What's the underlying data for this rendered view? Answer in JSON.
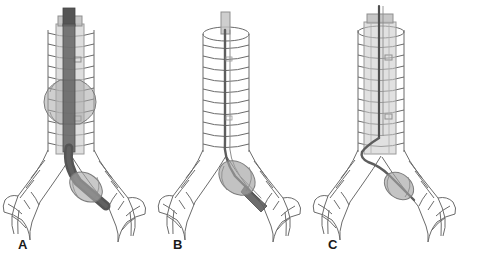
{
  "figure": {
    "background_color": "#ffffff",
    "width": 479,
    "height": 263,
    "panel_count": 3
  },
  "palette": {
    "outline": "#5a5a5a",
    "outline_light": "#8a8a8a",
    "airway_line": "#6b6b6b",
    "tube_translucent": "#c9c9c9",
    "tube_translucent_edge": "#9a9a9a",
    "blocker_dark": "#555555",
    "blocker_darker": "#3f3f3f",
    "cuff_gray": "#a8a8a8",
    "cuff_edge": "#7c7c7c",
    "balloon_gray": "#9e9e9e",
    "label_color": "#1a1a1a"
  },
  "panels": [
    {
      "id": "panel-a",
      "label": "A",
      "caption": "Endotracheal tube with inflated tracheal cuff and bronchial blocker advanced into the left mainstem bronchus",
      "has_endotracheal_tube": true,
      "has_tracheal_cuff": true,
      "blocker_type": "thick-dark-blocker",
      "blocker_cuff_inflated": true,
      "blocker_target": "left-mainstem-bronchus"
    },
    {
      "id": "panel-b",
      "label": "B",
      "caption": "Bronchial blocker catheter passed alone through the open trachea with balloon inflated in the left mainstem bronchus",
      "has_endotracheal_tube": false,
      "has_tracheal_cuff": false,
      "blocker_type": "thin-catheter",
      "blocker_cuff_inflated": true,
      "blocker_target": "left-mainstem-bronchus"
    },
    {
      "id": "panel-c",
      "label": "C",
      "caption": "Endotracheal tube with a thin blocker catheter passed alongside into the left mainstem bronchus",
      "has_endotracheal_tube": true,
      "has_tracheal_cuff": false,
      "blocker_type": "thin-catheter",
      "blocker_cuff_inflated": true,
      "blocker_target": "left-mainstem-bronchus"
    }
  ],
  "anatomy": {
    "structures": [
      "trachea",
      "tracheal-cartilage-rings",
      "carina",
      "left-mainstem-bronchus",
      "right-mainstem-bronchus",
      "lobar-bronchi"
    ],
    "tracheal_ring_count": 11,
    "view": "anterior-coronal"
  }
}
